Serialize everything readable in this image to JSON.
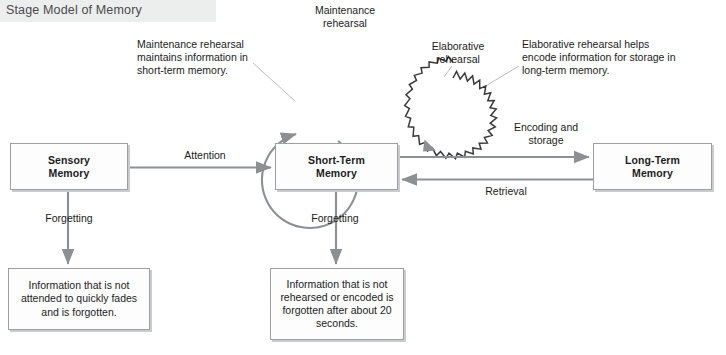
{
  "page": {
    "title": "Stage Model of Memory"
  },
  "boxes": {
    "sensory": {
      "name": "Sensory Memory",
      "line1": "Sensory",
      "line2": "Memory"
    },
    "short_term": {
      "name": "Short-Term Memory",
      "line1": "Short-Term",
      "line2": "Memory"
    },
    "long_term": {
      "name": "Long-Term Memory",
      "line1": "Long-Term",
      "line2": "Memory"
    },
    "sensory_note": {
      "text": "Information that is not attended to quickly fades and is forgotten."
    },
    "short_term_note": {
      "text": "Information that is not rehearsed or encoded is forgotten after about 20 seconds."
    }
  },
  "labels": {
    "maintenance_rehearsal_loop": "Maintenance rehearsal",
    "maintenance_rehearsal_note": "Maintenance rehearsal maintains information in short-term memory.",
    "elaborative_rehearsal_loop": "Elaborative rehearsal",
    "elaborative_rehearsal_note": "Elaborative rehearsal helps encode information for storage in long-term memory.",
    "attention": "Attention",
    "encoding_and_storage": "Encoding and storage",
    "retrieval": "Retrieval",
    "forgetting_sensory": "Forgetting",
    "forgetting_short_term": "Forgetting"
  },
  "colors": {
    "arrow": "#8d9093",
    "box_border": "#9d9fa2",
    "box_shadow": "#c9cbcd",
    "title_band": "#eceded",
    "title_text": "#4b4b4d",
    "text": "#1b1b1d",
    "leader_line": "#b4b6b8",
    "squiggle": "#3a3a3c"
  },
  "icons": {
    "maintenance_loop": "circular-loop-arrow-icon",
    "elaborative_loop": "squiggly-circular-loop-arrow-icon",
    "attention_arrow": "right-arrow-icon",
    "encoding_arrow": "right-arrow-icon",
    "retrieval_arrow": "left-arrow-icon",
    "forgetting_arrow": "down-arrow-icon"
  }
}
